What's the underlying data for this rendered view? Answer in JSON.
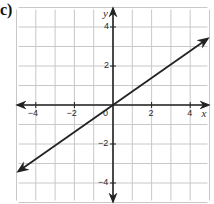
{
  "figure": {
    "part_label": "c)"
  },
  "chart_data": {
    "type": "line",
    "title": "",
    "xlabel": "x",
    "ylabel": "y",
    "xlim": [
      -5,
      5
    ],
    "ylim": [
      -5,
      5
    ],
    "grid": true,
    "grid_step": 1,
    "x_ticks": [
      {
        "value": -4,
        "label": "−4"
      },
      {
        "value": -2,
        "label": "−2"
      },
      {
        "value": 0,
        "label": "0"
      },
      {
        "value": 2,
        "label": "2"
      },
      {
        "value": 4,
        "label": "4"
      }
    ],
    "y_ticks": [
      {
        "value": 4,
        "label": "4"
      },
      {
        "value": 2,
        "label": "2"
      },
      {
        "value": -2,
        "label": "−2"
      },
      {
        "value": -4,
        "label": "−4"
      }
    ],
    "series": [
      {
        "name": "line",
        "equation": "y = 0.7x",
        "points": [
          [
            -4.9,
            -3.4
          ],
          [
            0,
            0
          ],
          [
            4.9,
            3.4
          ]
        ],
        "arrows": "both",
        "color": "#222222"
      }
    ],
    "colors": {
      "grid": "#c8c8c8",
      "axis": "#222222",
      "line": "#222222"
    }
  }
}
